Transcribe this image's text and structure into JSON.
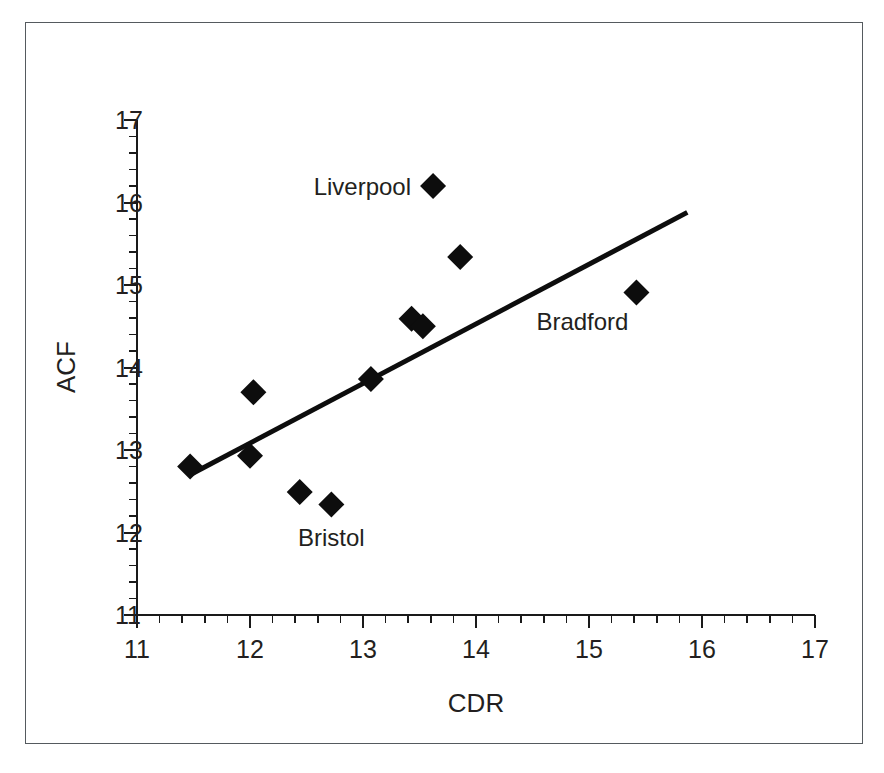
{
  "chart_data": {
    "type": "scatter",
    "title": "",
    "xlabel": "CDR",
    "ylabel": "ACF",
    "xlim": [
      11,
      17
    ],
    "ylim": [
      11,
      17
    ],
    "x_ticks": [
      "11",
      "12",
      "13",
      "14",
      "15",
      "16",
      "17"
    ],
    "y_ticks": [
      "11",
      "12",
      "13",
      "14",
      "15",
      "16",
      "17"
    ],
    "x_tick_values": [
      11,
      12,
      13,
      14,
      15,
      16,
      17
    ],
    "y_tick_values": [
      11,
      12,
      13,
      14,
      15,
      16,
      17
    ],
    "minor_tick_interval": 0.2,
    "grid": false,
    "legend": "none",
    "marker": "filled-diamond",
    "marker_color": "#0d0d0d",
    "series": [
      {
        "name": "cities",
        "points": [
          {
            "x": 11.47,
            "y": 12.8,
            "label": ""
          },
          {
            "x": 12.0,
            "y": 12.93,
            "label": ""
          },
          {
            "x": 12.03,
            "y": 13.7,
            "label": ""
          },
          {
            "x": 12.44,
            "y": 12.49,
            "label": ""
          },
          {
            "x": 12.72,
            "y": 12.34,
            "label": "Bristol"
          },
          {
            "x": 13.07,
            "y": 13.86,
            "label": ""
          },
          {
            "x": 13.43,
            "y": 14.59,
            "label": ""
          },
          {
            "x": 13.53,
            "y": 14.5,
            "label": ""
          },
          {
            "x": 13.62,
            "y": 16.2,
            "label": "Liverpool"
          },
          {
            "x": 13.86,
            "y": 15.34,
            "label": ""
          },
          {
            "x": 15.42,
            "y": 14.91,
            "label": "Bradford"
          }
        ]
      }
    ],
    "trend_line": {
      "x1": 11.47,
      "y1": 12.7,
      "x2": 15.87,
      "y2": 15.88,
      "color": "#0d0d0d"
    },
    "annotations": [
      {
        "text": "Liverpool",
        "position": "left-of-marker",
        "point_x": 13.62,
        "point_y": 16.2
      },
      {
        "text": "Bradford",
        "position": "below-left-of-marker",
        "point_x": 15.42,
        "point_y": 14.91
      },
      {
        "text": "Bristol",
        "position": "below-marker",
        "point_x": 12.72,
        "point_y": 12.34
      }
    ]
  }
}
